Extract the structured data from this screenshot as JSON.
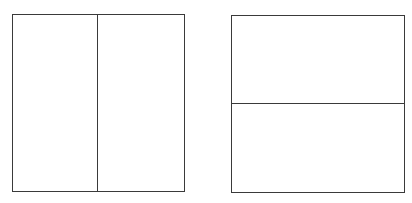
{
  "diagram": {
    "stroke_color": "#3a3a3a",
    "background_color": "#ffffff",
    "shapes": [
      {
        "id": "left-rectangle",
        "split": "vertical",
        "parts": 2,
        "box": {
          "left": 12,
          "top": 14,
          "width": 173,
          "height": 178
        },
        "divider_offset": 85
      },
      {
        "id": "right-rectangle",
        "split": "horizontal",
        "parts": 2,
        "box": {
          "left": 231,
          "top": 15,
          "width": 174,
          "height": 178
        },
        "divider_offset": 88
      }
    ]
  }
}
